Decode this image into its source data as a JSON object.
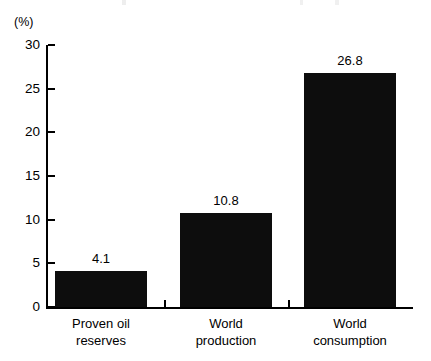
{
  "chart_data": {
    "type": "bar",
    "title": "",
    "subtitle": "",
    "xlabel": "",
    "ylabel": "",
    "unit_label": "(%)",
    "categories": [
      "Proven oil reserves",
      "World production",
      "World consumption"
    ],
    "category_lines": [
      [
        "Proven oil",
        "reserves"
      ],
      [
        "World",
        "production"
      ],
      [
        "World",
        "consumption"
      ]
    ],
    "values": [
      4.1,
      10.8,
      26.8
    ],
    "value_labels": [
      "4.1",
      "10.8",
      "26.8"
    ],
    "ylim": [
      0,
      30
    ],
    "yticks": [
      0,
      5,
      10,
      15,
      20,
      25,
      30
    ],
    "ytick_labels": [
      "0",
      "5",
      "10",
      "15",
      "20",
      "25",
      "30"
    ],
    "grid": false,
    "legend": null,
    "legend_position": "none",
    "bar_color": "#0d0d0d",
    "axis_color": "#000000",
    "background_color": "#ffffff"
  }
}
